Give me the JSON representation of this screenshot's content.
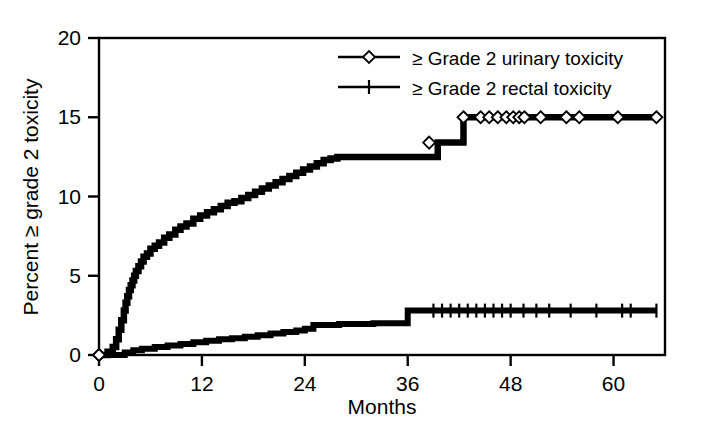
{
  "chart_data": {
    "type": "line",
    "title": "",
    "subtitle": "",
    "xlabel": "Months",
    "ylabel": "Percent ≥ grade 2 toxicity",
    "xlim": [
      0,
      66
    ],
    "ylim": [
      0,
      20
    ],
    "xticks": [
      0,
      12,
      24,
      36,
      48,
      60
    ],
    "xticklabels": [
      "0",
      "12",
      "24",
      "36",
      "48",
      "60"
    ],
    "yticks": [
      0,
      5,
      10,
      15,
      20
    ],
    "yticklabels": [
      "0",
      "5",
      "10",
      "15",
      "20"
    ],
    "grid": false,
    "legend_position": "top-right",
    "frame": "box",
    "line_color": "#000000",
    "background_color": "#ffffff",
    "curve_style": "step-post (Kaplan-Meier cumulative incidence) with censoring marks",
    "series": [
      {
        "name": "≥ Grade 2 urinary toxicity",
        "marker": "open-diamond",
        "x": [
          0,
          1.0,
          1.6,
          2.0,
          2.3,
          2.6,
          2.9,
          3.1,
          3.3,
          3.5,
          3.7,
          3.9,
          4.1,
          4.3,
          4.6,
          4.9,
          5.2,
          5.6,
          6.0,
          6.5,
          7.0,
          7.6,
          8.2,
          8.9,
          9.5,
          10.2,
          11.0,
          11.8,
          12.6,
          13.4,
          14.2,
          15.0,
          15.8,
          16.6,
          17.4,
          18.2,
          19.0,
          19.8,
          20.6,
          21.4,
          22.2,
          23.0,
          23.8,
          24.6,
          25.4,
          26.2,
          27.0,
          27.8,
          28.6,
          29.4,
          30.2,
          31.0,
          33.0,
          36.0,
          38.0,
          39.5,
          40.5,
          41.5,
          42.5,
          43.0,
          46.0,
          50.0,
          55.0,
          60.0,
          65.0
        ],
        "y": [
          0,
          0.2,
          0.5,
          1.0,
          1.6,
          2.2,
          2.8,
          3.3,
          3.7,
          4.1,
          4.4,
          4.7,
          5.0,
          5.3,
          5.6,
          5.9,
          6.2,
          6.4,
          6.7,
          6.9,
          7.1,
          7.4,
          7.6,
          7.9,
          8.1,
          8.3,
          8.6,
          8.8,
          9.0,
          9.2,
          9.4,
          9.6,
          9.7,
          9.9,
          10.1,
          10.3,
          10.5,
          10.7,
          10.9,
          11.1,
          11.3,
          11.5,
          11.7,
          11.9,
          12.1,
          12.3,
          12.4,
          12.5,
          12.5,
          12.5,
          12.5,
          12.5,
          12.5,
          12.5,
          12.5,
          13.4,
          13.4,
          13.4,
          15.0,
          15.0,
          15.0,
          15.0,
          15.0,
          15.0,
          15.0
        ],
        "final_value": 15.0,
        "censor_x": [
          0,
          38.5,
          42.5,
          44.5,
          45.5,
          46.5,
          47.5,
          48.3,
          49.0,
          49.6,
          51.5,
          54.5,
          56.0,
          60.5,
          65.0
        ],
        "censor_y": [
          0,
          13.4,
          15.0,
          15.0,
          15.0,
          15.0,
          15.0,
          15.0,
          15.0,
          15.0,
          15.0,
          15.0,
          15.0,
          15.0,
          15.0
        ]
      },
      {
        "name": "≥ Grade 2 rectal toxicity",
        "marker": "vertical-tick",
        "x": [
          0,
          2.0,
          3.0,
          4.0,
          5.0,
          6.5,
          8.0,
          9.5,
          11.0,
          12.5,
          14.0,
          15.5,
          17.0,
          18.5,
          20.0,
          21.5,
          23.0,
          24.0,
          25.0,
          26.5,
          28.0,
          30.0,
          32.0,
          34.0,
          36.0,
          40.0,
          45.0,
          50.0,
          55.0,
          60.0,
          65.0
        ],
        "y": [
          0,
          0.0,
          0.15,
          0.3,
          0.4,
          0.5,
          0.6,
          0.7,
          0.8,
          0.9,
          1.0,
          1.05,
          1.15,
          1.25,
          1.35,
          1.45,
          1.55,
          1.65,
          1.9,
          1.9,
          1.95,
          1.95,
          2.0,
          2.0,
          2.8,
          2.8,
          2.8,
          2.8,
          2.8,
          2.8,
          2.8
        ],
        "final_value": 2.8,
        "censor_x": [
          39.0,
          40.0,
          41.0,
          42.0,
          43.0,
          44.0,
          45.0,
          46.0,
          47.0,
          48.0,
          49.5,
          51.0,
          52.5,
          55.0,
          58.0,
          61.0,
          62.0,
          65.0
        ],
        "censor_y": [
          2.8,
          2.8,
          2.8,
          2.8,
          2.8,
          2.8,
          2.8,
          2.8,
          2.8,
          2.8,
          2.8,
          2.8,
          2.8,
          2.8,
          2.8,
          2.8,
          2.8,
          2.8
        ]
      }
    ]
  },
  "legend": {
    "items": [
      {
        "label": "≥ Grade 2 urinary toxicity",
        "marker": "open-diamond"
      },
      {
        "label": "≥ Grade 2 rectal toxicity",
        "marker": "vertical-tick"
      }
    ]
  },
  "axes": {
    "x_title": "Months",
    "y_title": "Percent ≥ grade 2 toxicity"
  }
}
